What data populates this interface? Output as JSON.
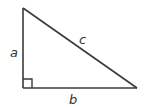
{
  "diagram": {
    "type": "right-triangle",
    "colors": {
      "stroke": "#3a3a3a",
      "text": "#333333",
      "background": "#ffffff"
    },
    "vertices": {
      "top": [
        23,
        8
      ],
      "right_angle": [
        23,
        88
      ],
      "right": [
        137,
        88
      ]
    },
    "labels": {
      "a": "a",
      "b": "b",
      "c": "c"
    },
    "right_angle_marker": {
      "size": 9
    }
  }
}
